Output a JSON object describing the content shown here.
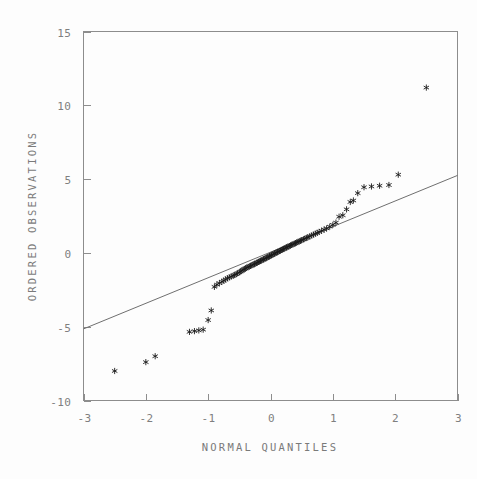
{
  "chart_data": {
    "type": "scatter",
    "title": "",
    "subtitle": "",
    "xlabel": "NORMAL QUANTILES",
    "ylabel": "ORDERED OBSERVATIONS",
    "xlim": [
      -3,
      3
    ],
    "ylim": [
      -10,
      15
    ],
    "xticks": [
      -3,
      -2,
      -1,
      0,
      1,
      2,
      3
    ],
    "xtick_labels": [
      "-3",
      "-2",
      "-1",
      "0",
      "1",
      "2",
      "3"
    ],
    "yticks": [
      -10,
      -5,
      0,
      5,
      10,
      15
    ],
    "ytick_labels": [
      "-10",
      "-5",
      "0",
      "5",
      "10",
      "15"
    ],
    "grid": false,
    "legend": false,
    "legend_position": "none",
    "marker": "asterisk",
    "marker_color": "#1a1a1a",
    "line_color": "#6f6f6f",
    "frame_color": "#8d8d8d",
    "background_color": "#fdfdfd",
    "reference_line": {
      "name": "normal reference line",
      "x": [
        -3,
        3
      ],
      "y": [
        -5.15,
        5.25
      ],
      "slope": 1.733,
      "intercept": 0.05
    },
    "series": [
      {
        "name": "ordered observations vs normal quantiles",
        "x": [
          -2.5,
          -2.0,
          -1.85,
          -1.3,
          -1.22,
          -1.15,
          -1.08,
          -1.0,
          -0.95,
          -0.9,
          -0.86,
          -0.82,
          -0.78,
          -0.75,
          -0.72,
          -0.69,
          -0.66,
          -0.63,
          -0.6,
          -0.58,
          -0.55,
          -0.53,
          -0.5,
          -0.48,
          -0.46,
          -0.44,
          -0.42,
          -0.4,
          -0.38,
          -0.36,
          -0.34,
          -0.32,
          -0.3,
          -0.28,
          -0.26,
          -0.25,
          -0.23,
          -0.21,
          -0.19,
          -0.18,
          -0.16,
          -0.14,
          -0.12,
          -0.11,
          -0.09,
          -0.07,
          -0.06,
          -0.04,
          -0.02,
          -0.01,
          0.01,
          0.02,
          0.04,
          0.06,
          0.07,
          0.09,
          0.11,
          0.12,
          0.14,
          0.16,
          0.18,
          0.19,
          0.21,
          0.23,
          0.25,
          0.26,
          0.28,
          0.3,
          0.32,
          0.34,
          0.36,
          0.38,
          0.4,
          0.42,
          0.44,
          0.46,
          0.48,
          0.5,
          0.53,
          0.55,
          0.58,
          0.6,
          0.63,
          0.66,
          0.69,
          0.72,
          0.75,
          0.78,
          0.82,
          0.86,
          0.9,
          0.95,
          1.0,
          1.05,
          1.1,
          1.16,
          1.22,
          1.28,
          1.33,
          1.4,
          1.5,
          1.62,
          1.75,
          1.9,
          2.05,
          2.5
        ],
        "y": [
          -8.0,
          -7.4,
          -7.0,
          -5.35,
          -5.3,
          -5.25,
          -5.2,
          -4.55,
          -3.9,
          -2.3,
          -2.15,
          -2.05,
          -1.95,
          -1.88,
          -1.8,
          -1.72,
          -1.66,
          -1.6,
          -1.55,
          -1.5,
          -1.44,
          -1.38,
          -1.32,
          -1.26,
          -1.2,
          -1.15,
          -1.1,
          -1.05,
          -1.0,
          -0.96,
          -0.92,
          -0.88,
          -0.84,
          -0.8,
          -0.76,
          -0.73,
          -0.69,
          -0.65,
          -0.61,
          -0.58,
          -0.54,
          -0.5,
          -0.46,
          -0.43,
          -0.39,
          -0.35,
          -0.32,
          -0.28,
          -0.24,
          -0.21,
          -0.17,
          -0.14,
          -0.1,
          -0.06,
          -0.03,
          0.01,
          0.05,
          0.08,
          0.12,
          0.16,
          0.2,
          0.23,
          0.27,
          0.31,
          0.35,
          0.38,
          0.42,
          0.46,
          0.5,
          0.54,
          0.58,
          0.62,
          0.66,
          0.7,
          0.74,
          0.78,
          0.82,
          0.86,
          0.92,
          0.96,
          1.02,
          1.06,
          1.12,
          1.18,
          1.24,
          1.3,
          1.36,
          1.42,
          1.5,
          1.58,
          1.66,
          1.78,
          1.9,
          2.05,
          2.45,
          2.55,
          2.95,
          3.45,
          3.55,
          4.05,
          4.45,
          4.5,
          4.55,
          4.6,
          5.3,
          11.2
        ]
      }
    ]
  }
}
